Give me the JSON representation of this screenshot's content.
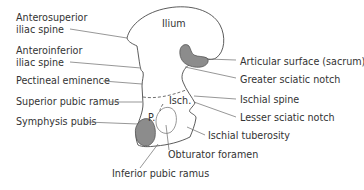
{
  "diagram": {
    "colors": {
      "outline": "#4a4a4a",
      "shaded_region": "#8c8c8c",
      "leader": "#6a6a6a",
      "text": "#333333"
    },
    "regions": {
      "ilium": "Ilium",
      "ischium": "Isch.",
      "pubis": "P."
    },
    "labels_left": [
      {
        "line1": "Anterosuperior",
        "line2": "iliac spine"
      },
      {
        "line1": "Anteroinferior",
        "line2": "iliac spine"
      },
      {
        "text": "Pectineal eminence"
      },
      {
        "text": "Superior pubic ramus"
      },
      {
        "text": "Symphysis pubis"
      }
    ],
    "labels_right": [
      {
        "text": "Articular surface (sacrum)"
      },
      {
        "text": "Greater sciatic notch"
      },
      {
        "text": "Ischial spine"
      },
      {
        "text": "Lesser sciatic notch"
      },
      {
        "text": "Ischial tuberosity"
      }
    ],
    "labels_bottom": [
      {
        "text": "Obturator foramen"
      },
      {
        "text": "Inferior pubic ramus"
      }
    ]
  }
}
